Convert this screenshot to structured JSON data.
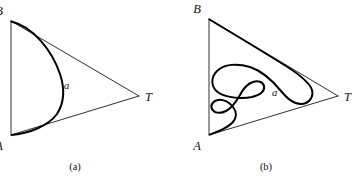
{
  "figure": {
    "background_color": "#ffffff",
    "stroke_color": "#000000",
    "edge_color": "#1a1a1a",
    "panels": [
      {
        "id": "panel-a",
        "caption": "(a)",
        "caption_x": 75,
        "caption_y": 161,
        "triangle": {
          "vertices": [
            {
              "name": "B",
              "label": "B",
              "x": 11,
              "y": 21,
              "label_x": 3,
              "label_y": 15
            },
            {
              "name": "A",
              "label": "A",
              "x": 11,
              "y": 135,
              "label_x": 3,
              "label_y": 150
            },
            {
              "name": "T",
              "label": "T",
              "x": 139,
              "y": 96,
              "label_x": 145,
              "label_y": 101
            }
          ],
          "edges": [
            {
              "from": "B",
              "to": "A",
              "path": "M 11 21 L 11 135"
            },
            {
              "from": "B",
              "to": "T",
              "path": "M 11 21 L 139 96"
            },
            {
              "from": "A",
              "to": "T",
              "path": "M 11 135 L 139 96"
            }
          ]
        },
        "curve": {
          "name": "a",
          "label": "a",
          "label_x": 64,
          "label_y": 89,
          "description": "simple convex arc bulging right from B to A",
          "path": "M 11.5 21.5 C 33 27 52 50 60 74 C 65 89 64 103 57 114 C 48 126 30 133 12 135"
        }
      },
      {
        "id": "panel-b",
        "caption": "(b)",
        "caption_x": 266,
        "caption_y": 161,
        "triangle": {
          "vertices": [
            {
              "name": "B",
              "label": "B",
              "x": 209,
              "y": 19,
              "label_x": 201,
              "label_y": 13
            },
            {
              "name": "A",
              "label": "A",
              "x": 209,
              "y": 135,
              "label_x": 201,
              "label_y": 150
            },
            {
              "name": "T",
              "label": "T",
              "x": 338,
              "y": 96,
              "label_x": 344,
              "label_y": 101
            }
          ],
          "edges": [
            {
              "from": "B",
              "to": "A",
              "path": "M 209 19 L 209 135"
            },
            {
              "from": "B",
              "to": "T",
              "path": "M 209 19 L 338 96"
            },
            {
              "from": "A",
              "to": "T",
              "path": "M 209 135 L 338 96"
            }
          ]
        },
        "curve": {
          "name": "a",
          "label": "a",
          "label_x": 272,
          "label_y": 96,
          "description": "wildly meandering curve from B to A with multiple hairpin folds",
          "path": "M 209.5 19.5 C 232 33 262 51 286 66 C 300 75 310 83 312 90 C 314 98 308 104 301 104 C 293 104 287 98 281 91 C 272 80 262 71 250 67 C 237 63 224 64 217 71 C 210 78 211 88 219 93 C 227 98 242 99 252 97 C 260 95 265 91 264 86 C 263 82 258 80 253 82 C 247 84 243 89 240 95 C 236 102 232 108 226 111 C 220 114 214 113 212 109 C 210 105 213 101 218 100 C 223 99 229 102 233 107 C 237 112 237 118 232 123 C 226 129 217 132 210 134.5"
        }
      }
    ]
  }
}
